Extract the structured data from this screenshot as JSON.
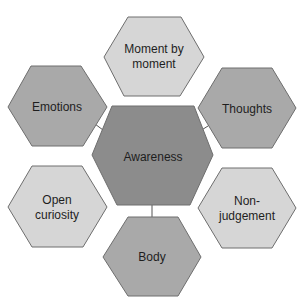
{
  "diagram": {
    "type": "hexagon-cluster",
    "colors": {
      "center": "#8c8c8c",
      "medium": "#a9a9a9",
      "light": "#d6d6d6",
      "outline": "#6e6e6e",
      "connector": "#555555",
      "background": "#ffffff",
      "text": "#1e1e1e"
    },
    "center": {
      "label": "Awareness"
    },
    "nodes": [
      {
        "id": "moment",
        "label": "Moment by\nmoment"
      },
      {
        "id": "emotions",
        "label": "Emotions"
      },
      {
        "id": "thoughts",
        "label": "Thoughts"
      },
      {
        "id": "open-curiosity",
        "label": "Open\ncuriosity"
      },
      {
        "id": "non-judgement",
        "label": "Non-judgement"
      },
      {
        "id": "body",
        "label": "Body"
      }
    ],
    "edges": [
      {
        "from": "Awareness",
        "to": "Emotions"
      },
      {
        "from": "Awareness",
        "to": "Thoughts"
      },
      {
        "from": "Awareness",
        "to": "Body"
      }
    ]
  }
}
